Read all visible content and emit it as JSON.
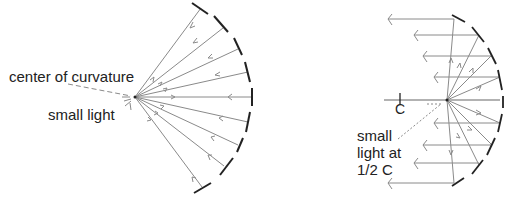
{
  "left_diagram": {
    "title": "Spherical mirror with small light at center of curvature",
    "labels": {
      "center": "center of curvature",
      "light": "small light"
    }
  },
  "right_diagram": {
    "title": "Spherical mirror with small light at 1/2 C",
    "labels": {
      "c_mark": "C",
      "light_line1": "small",
      "light_line2": "light at",
      "light_line3": "1/2 C"
    }
  },
  "colors": {
    "ray": "#8a8a8a",
    "mirror": "#222222",
    "text": "#222222"
  }
}
